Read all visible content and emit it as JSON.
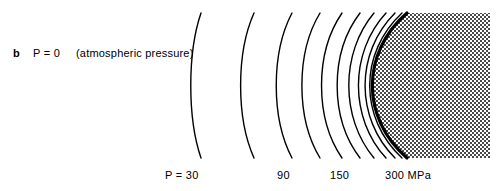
{
  "figure": {
    "panel_letter": "b",
    "pressure_label": "P = 0",
    "pressure_note": "(atmospheric pressure)",
    "width": 503,
    "height": 191,
    "background_color": "#ffffff",
    "line_color": "#000000",
    "stipple_color": "#555555"
  },
  "contour_labels": [
    {
      "text": "P = 30"
    },
    {
      "text": "90"
    },
    {
      "text": "150"
    },
    {
      "text": "300 MPa"
    }
  ],
  "chart_data": {
    "type": "line",
    "title": "",
    "xlabel": "",
    "ylabel": "",
    "grid": false,
    "legend": false,
    "units": "MPa",
    "contour_pressures": [
      0,
      30,
      60,
      90,
      120,
      150,
      180,
      210,
      240,
      270,
      300
    ],
    "contour_vertex_x": [
      188,
      237,
      272,
      297,
      316,
      331,
      342,
      351,
      357,
      361,
      363
    ],
    "contour_curvature": [
      13,
      17,
      20,
      23,
      26,
      29,
      32,
      35,
      38,
      41,
      44
    ],
    "contour_line_widths": [
      1.4,
      1.4,
      1.4,
      1.4,
      1.4,
      1.4,
      1.4,
      1.4,
      1.4,
      1.4,
      3.2
    ],
    "curve_top_y": 13,
    "curve_bottom_y": 158,
    "labeled_contours": [
      {
        "pressure": 30,
        "label": "P = 30",
        "label_x": 165
      },
      {
        "pressure": 90,
        "label": "90",
        "label_x": 277
      },
      {
        "pressure": 150,
        "label": "150",
        "label_x": 330
      },
      {
        "pressure": 300,
        "label": "300 MPa",
        "label_x": 385
      }
    ],
    "stipple_region": {
      "present": true,
      "fill": "dotted",
      "left_boundary": "300 MPa contour",
      "extends_to_x": 490,
      "top_y": 13,
      "bottom_y": 158
    }
  }
}
